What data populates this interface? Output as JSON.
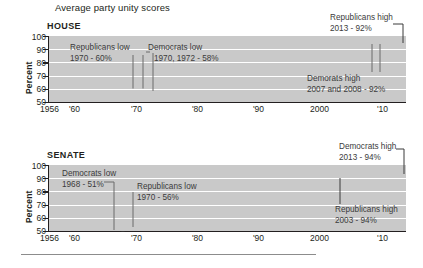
{
  "chart_title": "Average party unity scores",
  "panels": {
    "house": {
      "label": "HOUSE",
      "ylabel": "Percent",
      "yticks": [
        "100",
        "90",
        "80",
        "70",
        "60",
        "50"
      ],
      "xticks": [
        "1956",
        "'60",
        "'70",
        "'80",
        "'90",
        "2000",
        "'10"
      ],
      "annotations": {
        "rep_low_title": "Republicans low",
        "rep_low_value": "1970 - 60%",
        "dem_low_title": "Democrats low",
        "dem_low_value": "1970, 1972 - 58%",
        "rep_high_title": "Republicans high",
        "rep_high_value": "2013 - 92%",
        "dem_high_title": "Demorats high",
        "dem_high_value": "2007 and 2008 - 92%"
      }
    },
    "senate": {
      "label": "SENATE",
      "ylabel": "Percent",
      "yticks": [
        "100",
        "90",
        "80",
        "70",
        "60",
        "50"
      ],
      "xticks": [
        "1956",
        "'60",
        "'70",
        "'80",
        "'90",
        "2000",
        "'10"
      ],
      "annotations": {
        "dem_low_title": "Democrats low",
        "dem_low_value": "1968 - 51%",
        "rep_low_title": "Republicans low",
        "rep_low_value": "1970 - 56%",
        "dem_high_title": "Democrats high",
        "dem_high_value": "2013 - 94%",
        "rep_high_title": "Republicans high",
        "rep_high_value": "2003 - 94%"
      }
    }
  },
  "chart_data": [
    {
      "type": "line",
      "title": "HOUSE",
      "subtitle": "Average party unity scores",
      "xlabel": "",
      "ylabel": "Percent",
      "xlim": [
        1956,
        2014
      ],
      "ylim": [
        50,
        100
      ],
      "grid": true,
      "legend": "none",
      "xticks": [
        1956,
        1960,
        1970,
        1980,
        1990,
        2000,
        2010
      ],
      "xticklabels": [
        "1956",
        "'60",
        "'70",
        "'80",
        "'90",
        "2000",
        "'10"
      ],
      "yticks": [
        50,
        60,
        70,
        80,
        90,
        100
      ],
      "x": [
        1956,
        1957,
        1958,
        1959,
        1960,
        1961,
        1962,
        1963,
        1964,
        1965,
        1966,
        1967,
        1968,
        1969,
        1970,
        1971,
        1972,
        1973,
        1974,
        1975,
        1976,
        1977,
        1978,
        1979,
        1980,
        1981,
        1982,
        1983,
        1984,
        1985,
        1986,
        1987,
        1988,
        1989,
        1990,
        1991,
        1992,
        1993,
        1994,
        1995,
        1996,
        1997,
        1998,
        1999,
        2000,
        2001,
        2002,
        2003,
        2004,
        2005,
        2006,
        2007,
        2008,
        2009,
        2010,
        2011,
        2012,
        2013
      ],
      "series": [
        {
          "name": "Democrats",
          "color": "#3a3a3a",
          "values": [
            70,
            70,
            69,
            65,
            71,
            71,
            70,
            70,
            68,
            70,
            68,
            68,
            66,
            65,
            60,
            62,
            58,
            70,
            69,
            70,
            70,
            69,
            65,
            70,
            70,
            72,
            73,
            75,
            76,
            82,
            81,
            84,
            84,
            84,
            86,
            85,
            85,
            87,
            86,
            82,
            81,
            83,
            83,
            84,
            84,
            85,
            87,
            88,
            87,
            89,
            90,
            92,
            92,
            91,
            90,
            88,
            90,
            93
          ]
        },
        {
          "name": "Republicans",
          "color": "#6f6f6f",
          "values": [
            70,
            69,
            66,
            68,
            73,
            71,
            69,
            70,
            68,
            69,
            67,
            70,
            68,
            65,
            60,
            64,
            62,
            65,
            61,
            67,
            65,
            69,
            66,
            70,
            70,
            74,
            72,
            75,
            73,
            78,
            72,
            75,
            74,
            76,
            77,
            79,
            78,
            83,
            83,
            90,
            88,
            88,
            86,
            86,
            87,
            90,
            88,
            90,
            89,
            89,
            87,
            87,
            88,
            89,
            89,
            91,
            91,
            92
          ]
        }
      ],
      "annotations": [
        {
          "text": "Republicans low\n1970 - 60%",
          "point_x": 1970,
          "point_y": 60
        },
        {
          "text": "Democrats low\n1970, 1972 - 58%",
          "point_x": 1972,
          "point_y": 58
        },
        {
          "text": "Republicans high\n2013 - 92%",
          "point_x": 2013,
          "point_y": 92
        },
        {
          "text": "Demorats high\n2007 and 2008 - 92%",
          "point_x": 2007,
          "point_y": 92
        }
      ]
    },
    {
      "type": "line",
      "title": "SENATE",
      "subtitle": "",
      "xlabel": "",
      "ylabel": "Percent",
      "xlim": [
        1956,
        2014
      ],
      "ylim": [
        50,
        100
      ],
      "grid": true,
      "legend": "none",
      "xticks": [
        1956,
        1960,
        1970,
        1980,
        1990,
        2000,
        2010
      ],
      "xticklabels": [
        "1956",
        "'60",
        "'70",
        "'80",
        "'90",
        "2000",
        "'10"
      ],
      "yticks": [
        50,
        60,
        70,
        80,
        90,
        100
      ],
      "x": [
        1956,
        1957,
        1958,
        1959,
        1960,
        1961,
        1962,
        1963,
        1964,
        1965,
        1966,
        1967,
        1968,
        1969,
        1970,
        1971,
        1972,
        1973,
        1974,
        1975,
        1976,
        1977,
        1978,
        1979,
        1980,
        1981,
        1982,
        1983,
        1984,
        1985,
        1986,
        1987,
        1988,
        1989,
        1990,
        1991,
        1992,
        1993,
        1994,
        1995,
        1996,
        1997,
        1998,
        1999,
        2000,
        2001,
        2002,
        2003,
        2004,
        2005,
        2006,
        2007,
        2008,
        2009,
        2010,
        2011,
        2012,
        2013
      ],
      "series": [
        {
          "name": "Democrats",
          "color": "#3a3a3a",
          "values": [
            71,
            66,
            70,
            68,
            67,
            69,
            66,
            65,
            63,
            65,
            62,
            61,
            51,
            61,
            58,
            62,
            59,
            64,
            62,
            65,
            61,
            64,
            63,
            66,
            65,
            71,
            70,
            71,
            68,
            72,
            70,
            81,
            76,
            78,
            80,
            76,
            78,
            80,
            82,
            81,
            84,
            85,
            87,
            89,
            88,
            88,
            83,
            85,
            84,
            87,
            85,
            95,
            86,
            90,
            89,
            87,
            91,
            95
          ]
        },
        {
          "name": "Republicans",
          "color": "#6f6f6f",
          "values": [
            70,
            67,
            68,
            72,
            68,
            66,
            67,
            64,
            66,
            64,
            63,
            66,
            60,
            61,
            56,
            60,
            61,
            64,
            60,
            63,
            61,
            63,
            66,
            65,
            64,
            72,
            71,
            73,
            72,
            76,
            77,
            74,
            72,
            78,
            75,
            77,
            79,
            83,
            82,
            88,
            89,
            86,
            85,
            88,
            87,
            89,
            88,
            94,
            91,
            88,
            85,
            84,
            83,
            85,
            82,
            86,
            83,
            87
          ]
        }
      ],
      "annotations": [
        {
          "text": "Democrats low\n1968 - 51%",
          "point_x": 1968,
          "point_y": 51
        },
        {
          "text": "Republicans low\n1970 - 56%",
          "point_x": 1970,
          "point_y": 56
        },
        {
          "text": "Democrats high\n2013 - 94%",
          "point_x": 2013,
          "point_y": 94
        },
        {
          "text": "Republicans high\n2003 - 94%",
          "point_x": 2003,
          "point_y": 94
        }
      ]
    }
  ]
}
